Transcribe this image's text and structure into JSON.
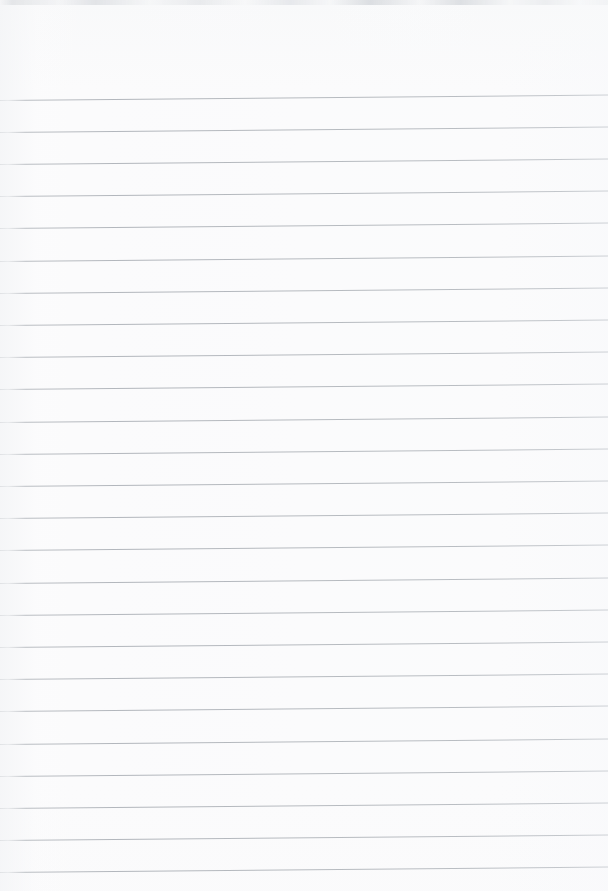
{
  "document": {
    "kind": "scanned-ruled-notebook-page",
    "title": "Blank lined paper",
    "page_width": 608,
    "page_height": 891,
    "paper_color": "#fbfbfc",
    "rule_color": "#b6babf",
    "rule_thickness_px": 1,
    "rule_spacing_px": 32.2,
    "first_rule_y": 99.5,
    "rule_count": 25,
    "skew_rise_px": 5.5,
    "has_left_margin_rule": false,
    "has_handwriting": false,
    "body_text": "",
    "artifact": {
      "name": "top-edge-scanner-smudge",
      "top": 0,
      "height": 5,
      "color": "#dcdee1"
    },
    "rules": [
      {
        "index": 1,
        "y": 99.5
      },
      {
        "index": 2,
        "y": 131.7
      },
      {
        "index": 3,
        "y": 163.9
      },
      {
        "index": 4,
        "y": 196.1
      },
      {
        "index": 5,
        "y": 228.3
      },
      {
        "index": 6,
        "y": 260.5
      },
      {
        "index": 7,
        "y": 292.7
      },
      {
        "index": 8,
        "y": 324.9
      },
      {
        "index": 9,
        "y": 357.1
      },
      {
        "index": 10,
        "y": 389.3
      },
      {
        "index": 11,
        "y": 421.5
      },
      {
        "index": 12,
        "y": 453.7
      },
      {
        "index": 13,
        "y": 485.9
      },
      {
        "index": 14,
        "y": 518.1
      },
      {
        "index": 15,
        "y": 550.3
      },
      {
        "index": 16,
        "y": 582.5
      },
      {
        "index": 17,
        "y": 614.7
      },
      {
        "index": 18,
        "y": 646.9
      },
      {
        "index": 19,
        "y": 679.1
      },
      {
        "index": 20,
        "y": 711.3
      },
      {
        "index": 21,
        "y": 743.5
      },
      {
        "index": 22,
        "y": 775.7
      },
      {
        "index": 23,
        "y": 807.9
      },
      {
        "index": 24,
        "y": 840.1
      },
      {
        "index": 25,
        "y": 872.3
      }
    ]
  }
}
